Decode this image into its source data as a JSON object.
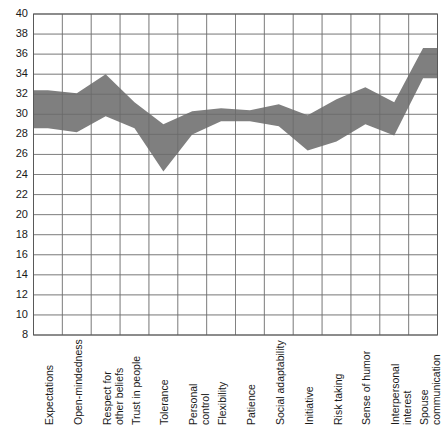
{
  "chart_data": {
    "type": "area",
    "title": "",
    "subtitle": "",
    "xlabel": "",
    "ylabel": "",
    "ylim": [
      8,
      40
    ],
    "ytick_step": 2,
    "yticks": [
      40,
      38,
      36,
      34,
      32,
      30,
      28,
      26,
      24,
      22,
      20,
      18,
      16,
      14,
      12,
      10,
      8
    ],
    "grid": true,
    "legend": "none",
    "band_color": "#7f7f7f",
    "grid_color": "#808080",
    "plot_background": "#ffffff",
    "categories": [
      "Expectations",
      "Open-mindedness",
      "Respect for\nother beliefs",
      "Trust in people",
      "Tolerance",
      "Personal\ncontrol",
      "Flexibility",
      "Patience",
      "Social adaptability",
      "Initiative",
      "Risk taking",
      "Sense of humor",
      "Interpersonal\ninterest",
      "Spouse\ncommunication"
    ],
    "series": [
      {
        "name": "upper",
        "values": [
          32.4,
          32.1,
          34.0,
          31.2,
          29.0,
          30.3,
          30.6,
          30.4,
          31.0,
          29.9,
          31.5,
          32.7,
          31.2,
          36.6
        ]
      },
      {
        "name": "lower",
        "values": [
          28.6,
          28.2,
          29.8,
          28.6,
          24.3,
          28.0,
          29.3,
          29.3,
          28.8,
          26.4,
          27.3,
          29.0,
          27.9,
          33.6
        ]
      }
    ]
  }
}
